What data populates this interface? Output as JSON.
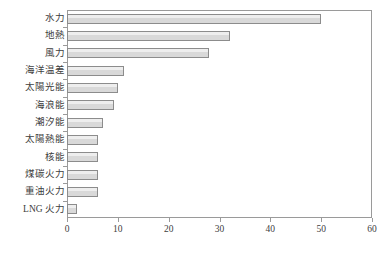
{
  "chart_data": {
    "type": "bar",
    "orientation": "horizontal",
    "title": "",
    "subtitle": "",
    "xlabel": "",
    "ylabel": "",
    "xlim": [
      0,
      60
    ],
    "xticks": [
      0,
      10,
      20,
      30,
      40,
      50,
      60
    ],
    "xtick_labels": [
      "0",
      "10",
      "20",
      "30",
      "40",
      "50",
      "60"
    ],
    "grid": false,
    "legend": null,
    "categories": [
      "水力",
      "地熱",
      "風力",
      "海洋温差",
      "太陽光能",
      "海浪能",
      "潮汐能",
      "太陽熱能",
      "核能",
      "煤碳火力",
      "重油火力",
      "LNG 火力"
    ],
    "values": [
      50,
      32,
      28,
      11.2,
      10,
      9.2,
      7.1,
      6.1,
      6.1,
      6.1,
      6.1,
      2
    ],
    "bar_fill": "#d9d9d9",
    "bar_border": "#8c8c8c",
    "axis_color": "#9a9a9a"
  }
}
